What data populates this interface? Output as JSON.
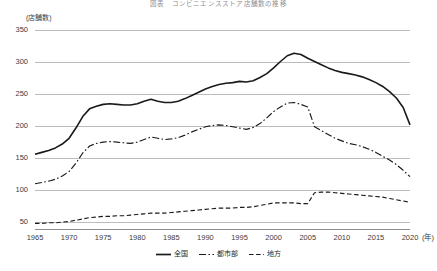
{
  "chart_data": {
    "type": "line",
    "title": "図表　コンビニエンスストア店舗数の推移",
    "xlabel": "(年)",
    "ylabel": "(店舗数)",
    "xlim": [
      1965,
      2020
    ],
    "ylim": [
      50,
      350
    ],
    "grid": true,
    "legend_position": "bottom-center",
    "y_ticks": [
      350,
      300,
      250,
      200,
      150,
      100,
      50
    ],
    "x_ticks": [
      1965,
      1970,
      1975,
      1980,
      1985,
      1990,
      1995,
      2000,
      2005,
      2010,
      2015,
      2020
    ],
    "series": [
      {
        "name": "全国",
        "style": "solid",
        "color": "#1a1a1a",
        "x": [
          1965,
          1966,
          1967,
          1968,
          1969,
          1970,
          1971,
          1972,
          1973,
          1974,
          1975,
          1976,
          1977,
          1978,
          1979,
          1980,
          1981,
          1982,
          1983,
          1984,
          1985,
          1986,
          1987,
          1988,
          1989,
          1990,
          1991,
          1992,
          1993,
          1994,
          1995,
          1996,
          1997,
          1998,
          1999,
          2000,
          2001,
          2002,
          2003,
          2004,
          2005,
          2006,
          2007,
          2008,
          2009,
          2010,
          2011,
          2012,
          2013,
          2014,
          2015,
          2016,
          2017,
          2018,
          2019,
          2020
        ],
        "values": [
          155,
          158,
          161,
          165,
          171,
          180,
          196,
          214,
          226,
          230,
          233,
          234,
          233,
          232,
          232,
          234,
          238,
          241,
          238,
          236,
          236,
          238,
          242,
          247,
          252,
          257,
          261,
          264,
          266,
          267,
          269,
          268,
          270,
          275,
          281,
          290,
          300,
          309,
          313,
          311,
          305,
          300,
          295,
          290,
          286,
          283,
          281,
          279,
          276,
          272,
          267,
          261,
          253,
          243,
          228,
          201
        ]
      },
      {
        "name": "都市部",
        "style": "dashdot",
        "color": "#1a1a1a",
        "x": [
          1965,
          1966,
          1967,
          1968,
          1969,
          1970,
          1971,
          1972,
          1973,
          1974,
          1975,
          1976,
          1977,
          1978,
          1979,
          1980,
          1981,
          1982,
          1983,
          1984,
          1985,
          1986,
          1987,
          1988,
          1989,
          1990,
          1991,
          1992,
          1993,
          1994,
          1995,
          1996,
          1997,
          1998,
          1999,
          2000,
          2001,
          2002,
          2003,
          2004,
          2005,
          2006,
          2007,
          2008,
          2009,
          2010,
          2011,
          2012,
          2013,
          2014,
          2015,
          2016,
          2017,
          2018,
          2019,
          2020
        ],
        "values": [
          109,
          111,
          113,
          116,
          121,
          128,
          141,
          157,
          168,
          172,
          174,
          175,
          174,
          173,
          172,
          174,
          178,
          182,
          180,
          178,
          179,
          181,
          185,
          190,
          194,
          198,
          200,
          201,
          200,
          198,
          196,
          194,
          197,
          203,
          212,
          222,
          229,
          235,
          236,
          233,
          229,
          198,
          192,
          186,
          180,
          176,
          172,
          170,
          167,
          163,
          158,
          152,
          146,
          139,
          130,
          120
        ]
      },
      {
        "name": "地方",
        "style": "dashed",
        "color": "#1a1a1a",
        "x": [
          1965,
          1966,
          1967,
          1968,
          1969,
          1970,
          1971,
          1972,
          1973,
          1974,
          1975,
          1976,
          1977,
          1978,
          1979,
          1980,
          1981,
          1982,
          1983,
          1984,
          1985,
          1986,
          1987,
          1988,
          1989,
          1990,
          1991,
          1992,
          1993,
          1994,
          1995,
          1996,
          1997,
          1998,
          1999,
          2000,
          2001,
          2002,
          2003,
          2004,
          2005,
          2006,
          2007,
          2008,
          2009,
          2010,
          2011,
          2012,
          2013,
          2014,
          2015,
          2016,
          2017,
          2018,
          2019,
          2020
        ],
        "values": [
          47,
          47,
          48,
          48,
          49,
          50,
          52,
          54,
          56,
          57,
          58,
          58,
          59,
          59,
          60,
          61,
          62,
          63,
          63,
          63,
          64,
          65,
          66,
          67,
          68,
          69,
          70,
          71,
          71,
          71,
          72,
          72,
          73,
          75,
          77,
          79,
          79,
          79,
          79,
          78,
          78,
          95,
          96,
          96,
          95,
          94,
          93,
          92,
          91,
          90,
          89,
          88,
          86,
          84,
          82,
          80
        ]
      }
    ]
  },
  "axis": {
    "y_unit": "(店舗数)",
    "x_unit": "(年)"
  },
  "legend": {
    "items": [
      {
        "label": "全国",
        "style": "solid"
      },
      {
        "label": "都市部",
        "style": "dashdot"
      },
      {
        "label": "地方",
        "style": "dashed"
      }
    ]
  }
}
